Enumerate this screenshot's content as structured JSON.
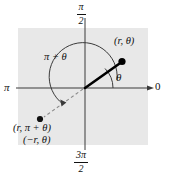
{
  "figure": {
    "background_color": "#e8e8e8",
    "plot_area": {
      "x": 18,
      "y": 28,
      "width": 130,
      "height": 117
    },
    "origin": {
      "x": 85,
      "y": 88
    },
    "axes": {
      "horizontal_right_label": "0",
      "horizontal_left_label": "π",
      "vertical_top": {
        "numerator": "π",
        "denominator": "2"
      },
      "vertical_bottom": {
        "numerator": "3π",
        "denominator": "2"
      },
      "axis_color": "#3a3a3a"
    },
    "ray": {
      "color": "#000000",
      "from": {
        "x": 85,
        "y": 88
      },
      "to": {
        "x": 122,
        "y": 62
      },
      "point_label": "(r, θ)",
      "angle_label": "θ"
    },
    "opposite_ray": {
      "style": "dashed",
      "color": "#6b6b6b",
      "from": {
        "x": 85,
        "y": 88
      },
      "to": {
        "x": 42,
        "y": 118
      },
      "point_labels": [
        "(r, π + θ)",
        "(−r, θ)"
      ]
    },
    "arc": {
      "label": "π + θ",
      "color": "#3a3a3a",
      "has_arrowhead": true
    }
  }
}
